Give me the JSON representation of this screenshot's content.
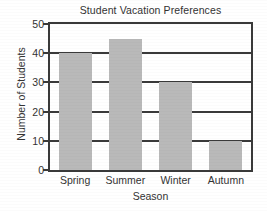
{
  "chart_data": {
    "type": "bar",
    "title": "Student Vacation Preferences",
    "xlabel": "Season",
    "ylabel": "Number of Students",
    "categories": [
      "Spring",
      "Summer",
      "Winter",
      "Autumn"
    ],
    "values": [
      40,
      45,
      30,
      10
    ],
    "ylim": [
      0,
      50
    ],
    "yticks": [
      0,
      10,
      20,
      30,
      40,
      50
    ],
    "ytick_labels": [
      "0",
      "10",
      "20",
      "30",
      "40",
      "50"
    ],
    "grid": "horizontal",
    "legend": "none",
    "bar_color": "#b9b9b9",
    "axis_color": "#3a3a3a",
    "background_color": "#ffffff"
  }
}
